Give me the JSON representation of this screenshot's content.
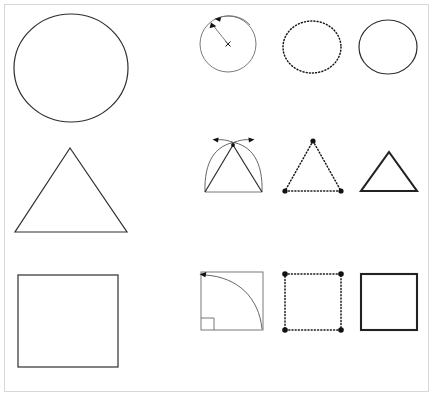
{
  "figure": {
    "title": "Geometric construction steps for circle, triangle and square",
    "background_color": "#ffffff",
    "frame_color": "#d8d8d8",
    "ink_color": "#2e2e2e",
    "rows": [
      {
        "name": "circle-row",
        "shape": "circle",
        "cells": [
          {
            "name": "large-circle",
            "caption": ""
          },
          {
            "name": "circle-construction",
            "caption": "",
            "markers": [
              "center-x-mark",
              "radius-line",
              "compass-arrow",
              "rotation-arc-arrow"
            ]
          },
          {
            "name": "circle-dotted-outline",
            "caption": ""
          },
          {
            "name": "circle-final",
            "caption": ""
          }
        ]
      },
      {
        "name": "triangle-row",
        "shape": "triangle",
        "cells": [
          {
            "name": "large-triangle",
            "caption": ""
          },
          {
            "name": "triangle-construction",
            "caption": "",
            "markers": [
              "left-arc",
              "right-arc",
              "left-arrow",
              "right-arrow",
              "apex-point"
            ]
          },
          {
            "name": "triangle-dotted-outline",
            "caption": "",
            "markers": [
              "apex-vertex",
              "left-vertex",
              "right-vertex"
            ]
          },
          {
            "name": "triangle-final",
            "caption": ""
          }
        ]
      },
      {
        "name": "square-row",
        "shape": "square",
        "cells": [
          {
            "name": "large-square",
            "caption": ""
          },
          {
            "name": "square-construction",
            "caption": "",
            "markers": [
              "quarter-arc",
              "arc-arrow",
              "right-angle-marker"
            ]
          },
          {
            "name": "square-dotted-outline",
            "caption": "",
            "markers": [
              "corner-vertex-tl",
              "corner-vertex-tr",
              "corner-vertex-bl",
              "corner-vertex-br"
            ]
          },
          {
            "name": "square-final",
            "caption": ""
          }
        ]
      }
    ]
  }
}
